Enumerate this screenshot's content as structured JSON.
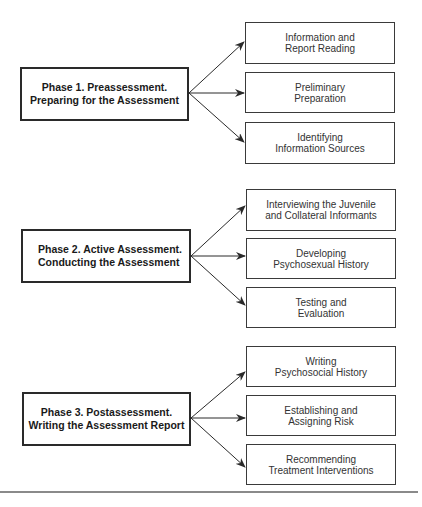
{
  "phases": [
    {
      "title_line1": "Phase 1. Preassessment.",
      "title_line2": "Preparing for the Assessment",
      "steps": [
        {
          "line1": "Information and",
          "line2": "Report Reading"
        },
        {
          "line1": "Preliminary",
          "line2": "Preparation"
        },
        {
          "line1": "Identifying",
          "line2": "Information Sources"
        }
      ]
    },
    {
      "title_line1": "Phase 2.  Active Assessment.",
      "title_line2": "Conducting the Assessment",
      "steps": [
        {
          "line1": "Interviewing the Juvenile",
          "line2": "and Collateral Informants"
        },
        {
          "line1": "Developing",
          "line2": "Psychosexual History"
        },
        {
          "line1": "Testing and",
          "line2": "Evaluation"
        }
      ]
    },
    {
      "title_line1": "Phase 3. Postassessment.",
      "title_line2": "Writing the Assessment Report",
      "steps": [
        {
          "line1": "Writing",
          "line2": "Psychosocial History"
        },
        {
          "line1": "Establishing and",
          "line2": "Assigning Risk"
        },
        {
          "line1": "Recommending",
          "line2": "Treatment Interventions"
        }
      ]
    }
  ],
  "icons": {
    "arrow": "arrow-right-icon"
  },
  "colors": {
    "line": "#2a2a2a",
    "text": "#1a1a1a",
    "rule": "#8a8a8a"
  }
}
